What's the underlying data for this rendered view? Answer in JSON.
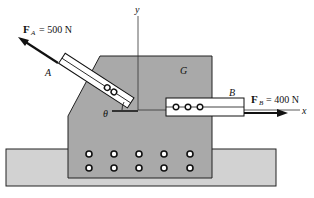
{
  "diagram": {
    "axes": {
      "x_label": "x",
      "y_label": "y"
    },
    "gusset_label": "G",
    "member_a": {
      "label": "A",
      "force_symbol": "F",
      "force_subscript": "A",
      "force_value": "= 500 N"
    },
    "member_b": {
      "label": "B",
      "force_symbol": "F",
      "force_subscript": "B",
      "force_value": "= 400 N"
    },
    "angle_label": "θ",
    "colors": {
      "plate": "#a9a9a9",
      "base": "#d2d2d2",
      "stroke": "#222222",
      "member": "#ffffff"
    }
  }
}
